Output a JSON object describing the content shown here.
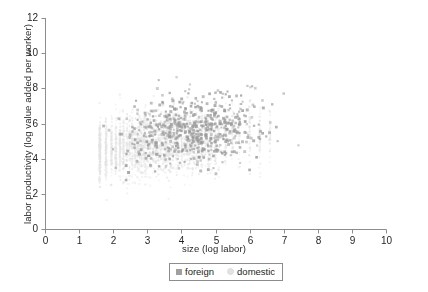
{
  "figure": {
    "width": 428,
    "height": 292,
    "background": "#ffffff"
  },
  "chart_data": {
    "type": "scatter",
    "title": "",
    "subtitle": "",
    "xlabel": "size (log labor)",
    "ylabel": "labor productivity (log value added per worker)",
    "xlim": [
      0,
      10
    ],
    "ylim": [
      0,
      12
    ],
    "xticks": [
      0,
      1,
      2,
      3,
      4,
      5,
      6,
      7,
      8,
      9,
      10
    ],
    "yticks": [
      0,
      2,
      4,
      6,
      8,
      10,
      12
    ],
    "xtick_labels": [
      "0",
      "1",
      "2",
      "3",
      "4",
      "5",
      "6",
      "7",
      "8",
      "9",
      "10"
    ],
    "ytick_labels": [
      "0",
      "2",
      "4",
      "6",
      "8",
      "10",
      "12"
    ],
    "grid": false,
    "legend_position": "below-axis-center",
    "axis_color": "#8d8d8d",
    "tick_label_color": "#231f20",
    "series": [
      {
        "name": "domestic",
        "marker": "circle",
        "color": "#e3e3e3",
        "size": 2.0,
        "count": 2600,
        "note": "very light gray small dots forming vertical columns at discrete log-labor values; dense core from x 1.6 to 4.2 and y 3.2 to 6.2",
        "x_range": [
          1.55,
          7.2
        ],
        "y_range": [
          1.1,
          8.6
        ],
        "x_mean": 3.0,
        "y_mean": 4.8,
        "columns": [
          1.61,
          1.79,
          1.95,
          2.08,
          2.2,
          2.3,
          2.4,
          2.48,
          2.56,
          2.64,
          2.71,
          2.77,
          2.83,
          2.89,
          2.94,
          3.0,
          3.09,
          3.18,
          3.26,
          3.33,
          3.4,
          3.47,
          3.53,
          3.58,
          3.64,
          3.69,
          3.76,
          3.85,
          3.91,
          4.01,
          4.09,
          4.18,
          4.25,
          4.32,
          4.38,
          4.44,
          4.5,
          4.6,
          4.7,
          4.79,
          4.87,
          5.0,
          5.1,
          5.3,
          5.5,
          5.7,
          6.0,
          6.3,
          6.6
        ]
      },
      {
        "name": "foreign",
        "marker": "square",
        "color": "#9b9b9b",
        "size": 2.6,
        "count": 620,
        "note": "medium gray squares spread wider in x; dense core from x 3.0 to 5.8 and y 4.0 to 7.0",
        "x_range": [
          1.7,
          8.1
        ],
        "y_range": [
          1.6,
          9.8
        ],
        "x_mean": 4.4,
        "y_mean": 5.6
      }
    ]
  },
  "legend": {
    "entries": [
      {
        "label": "foreign",
        "marker": "square",
        "color": "#9b9b9b"
      },
      {
        "label": "domestic",
        "marker": "circle",
        "color": "#e3e3e3"
      }
    ]
  }
}
